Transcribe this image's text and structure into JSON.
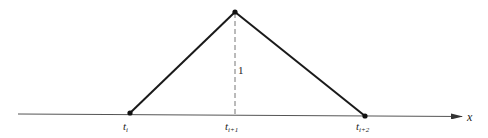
{
  "diagram": {
    "type": "hat-function",
    "axis": {
      "label": "x"
    },
    "height_label": "1",
    "knots": [
      {
        "base": "t",
        "sub": "i"
      },
      {
        "base": "t",
        "sub": "i+1"
      },
      {
        "base": "t",
        "sub": "i+2"
      }
    ],
    "colors": {
      "line": "#1a1a1a",
      "axis": "#555555",
      "dashed": "#777777"
    }
  }
}
